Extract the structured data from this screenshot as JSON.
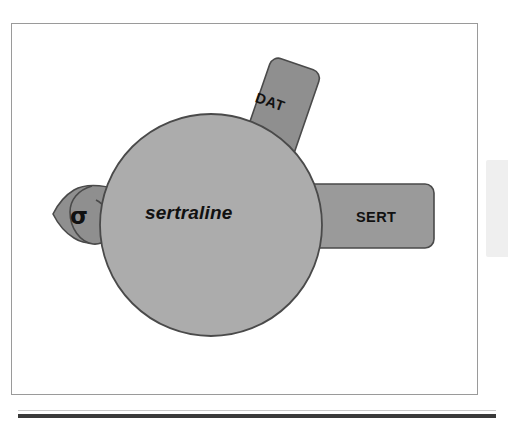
{
  "figure": {
    "type": "diagram",
    "center": {
      "label": "sertraline",
      "shape": "circle",
      "fill_color": "#ACACAC",
      "stroke_color": "#4A4A4A"
    },
    "tabs": [
      {
        "id": "dat",
        "label": "DAT",
        "meaning": "dopamine transporter",
        "shape": "rounded-rectangle",
        "position": "top",
        "rotation_deg": 19,
        "fill_color": "#8F8F8F",
        "stroke_color": "#4A4A4A"
      },
      {
        "id": "sert",
        "label": "SERT",
        "meaning": "serotonin transporter",
        "shape": "rounded-rectangle",
        "position": "right",
        "rotation_deg": 0,
        "fill_color": "#9A9A9A",
        "stroke_color": "#4A4A4A"
      },
      {
        "id": "sigma",
        "label": "σ",
        "meaning": "sigma receptor",
        "shape": "teardrop",
        "position": "left",
        "rotation_deg": 0,
        "fill_color": "#8F8F8F",
        "stroke_color": "#4A4A4A"
      }
    ],
    "frame": {
      "border_color": "#9A9A9A",
      "background_color": "#FFFFFF"
    },
    "bottom_rule_color": "#3A3A3A",
    "right_panel_color": "#EFEFEF"
  }
}
